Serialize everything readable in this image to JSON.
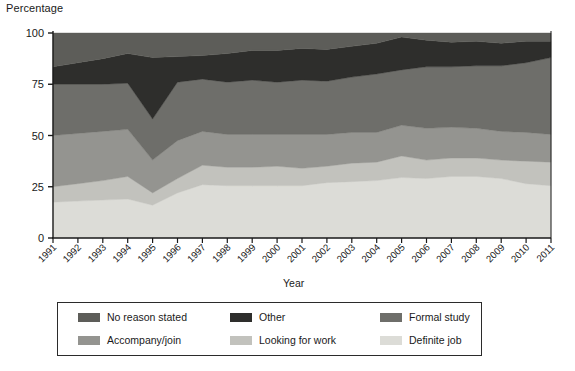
{
  "chart_data": {
    "type": "area",
    "title": "",
    "subtitle": "",
    "ylabel": "Percentage",
    "xlabel": "Year",
    "ylim": [
      0,
      100
    ],
    "yticks": [
      0,
      25,
      50,
      75,
      100
    ],
    "grid": false,
    "stacked": true,
    "legend_position": "bottom",
    "categories": [
      "1991",
      "1992",
      "1993",
      "1994",
      "1995",
      "1996",
      "1997",
      "1998",
      "1999",
      "2000",
      "2001",
      "2002",
      "2003",
      "2004",
      "2005",
      "2006",
      "2007",
      "2008",
      "2009",
      "2010",
      "2011"
    ],
    "series": [
      {
        "name": "Definite job",
        "color": "#dcdcd7",
        "values": [
          17.5,
          18.0,
          18.5,
          19.0,
          16.0,
          22.0,
          26.0,
          25.5,
          25.5,
          25.5,
          25.5,
          27.0,
          27.5,
          28.0,
          29.5,
          29.0,
          30.0,
          30.0,
          29.0,
          26.5,
          25.5
        ]
      },
      {
        "name": "Looking for work",
        "color": "#c2c2bd",
        "values": [
          7.5,
          8.5,
          9.5,
          11.0,
          6.0,
          7.0,
          9.5,
          9.0,
          9.0,
          9.5,
          8.5,
          8.0,
          9.0,
          9.0,
          10.5,
          9.0,
          9.0,
          9.0,
          9.0,
          11.0,
          11.5
        ]
      },
      {
        "name": "Accompany/join",
        "color": "#949490",
        "values": [
          25.0,
          24.5,
          24.0,
          23.0,
          16.0,
          18.5,
          16.5,
          16.0,
          16.0,
          15.5,
          16.5,
          15.5,
          15.0,
          14.5,
          15.0,
          15.5,
          15.0,
          14.5,
          14.0,
          14.0,
          13.5
        ]
      },
      {
        "name": "Formal study",
        "color": "#6e6e6a",
        "values": [
          25.0,
          24.0,
          23.0,
          22.5,
          20.0,
          28.5,
          25.5,
          25.5,
          26.5,
          25.5,
          26.5,
          26.0,
          27.0,
          28.5,
          27.0,
          30.0,
          29.5,
          30.5,
          32.0,
          34.0,
          37.5
        ]
      },
      {
        "name": "Other",
        "color": "#2e2e2c",
        "values": [
          8.5,
          10.5,
          12.5,
          14.5,
          30.0,
          12.5,
          11.5,
          14.0,
          14.5,
          15.5,
          15.5,
          15.5,
          15.0,
          15.0,
          16.0,
          13.0,
          12.0,
          12.0,
          11.0,
          10.5,
          8.0
        ]
      },
      {
        "name": "No reason stated",
        "color": "#5d5d59",
        "values": [
          16.5,
          14.5,
          12.5,
          10.0,
          12.0,
          11.5,
          11.0,
          10.0,
          8.5,
          8.5,
          7.5,
          8.0,
          6.5,
          5.0,
          2.0,
          3.5,
          4.5,
          4.0,
          5.0,
          4.0,
          4.0
        ]
      }
    ]
  },
  "axes": {
    "y_title": "Percentage",
    "x_title": "Year"
  },
  "legend": {
    "items": [
      {
        "label": "No reason stated",
        "color": "#5d5d59"
      },
      {
        "label": "Other",
        "color": "#2e2e2c"
      },
      {
        "label": "Formal study",
        "color": "#6e6e6a"
      },
      {
        "label": "Accompany/join",
        "color": "#949490"
      },
      {
        "label": "Looking for work",
        "color": "#c2c2bd"
      },
      {
        "label": "Definite job",
        "color": "#dcdcd7"
      }
    ]
  }
}
